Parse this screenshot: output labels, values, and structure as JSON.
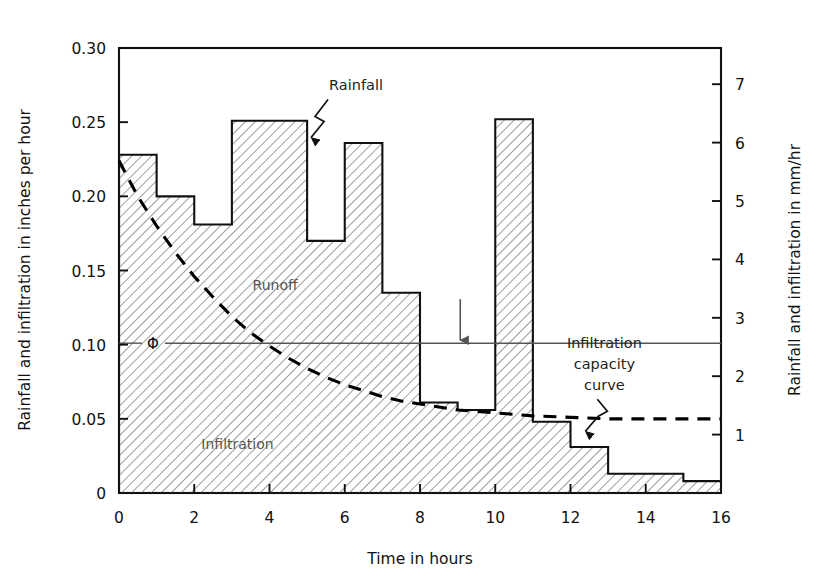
{
  "chart_data": {
    "type": "bar",
    "title": "",
    "subtitle": "",
    "xlabel": "Time in hours",
    "ylabel": "Rainfall and infiltration in inches per hour",
    "y2label": "Rainfall and infiltration in mm/hr",
    "xlim": [
      0,
      16
    ],
    "ylim": [
      0,
      0.3
    ],
    "y2lim": [
      0,
      7.62
    ],
    "grid": false,
    "legend_position": "none",
    "xticks": [
      0,
      2,
      4,
      6,
      8,
      10,
      12,
      14,
      16
    ],
    "xticklabels": [
      "0",
      "2",
      "4",
      "6",
      "8",
      "10",
      "12",
      "14",
      "16"
    ],
    "yticks": [
      0,
      0.05,
      0.1,
      0.15,
      0.2,
      0.25,
      0.3
    ],
    "yticklabels": [
      "0",
      "0.05",
      "0.10",
      "0.15",
      "0.20",
      "0.25",
      "0.30"
    ],
    "y2ticks": [
      1,
      2,
      3,
      4,
      5,
      6,
      7
    ],
    "y2ticklabels": [
      "1",
      "2",
      "3",
      "4",
      "5",
      "6",
      "7"
    ],
    "series": [
      {
        "name": "Rainfall hyetograph",
        "type": "step-bar",
        "unit": "inches per hour",
        "bins": [
          {
            "x0": 0,
            "x1": 1,
            "value": 0.228
          },
          {
            "x0": 1,
            "x1": 2,
            "value": 0.2
          },
          {
            "x0": 2,
            "x1": 3,
            "value": 0.181
          },
          {
            "x0": 3,
            "x1": 5,
            "value": 0.251
          },
          {
            "x0": 5,
            "x1": 6,
            "value": 0.17
          },
          {
            "x0": 6,
            "x1": 7,
            "value": 0.236
          },
          {
            "x0": 7,
            "x1": 8,
            "value": 0.135
          },
          {
            "x0": 8,
            "x1": 9,
            "value": 0.061
          },
          {
            "x0": 9,
            "x1": 10,
            "value": 0.056
          },
          {
            "x0": 10,
            "x1": 11,
            "value": 0.252
          },
          {
            "x0": 11,
            "x1": 12,
            "value": 0.048
          },
          {
            "x0": 12,
            "x1": 13,
            "value": 0.031
          },
          {
            "x0": 13,
            "x1": 15,
            "value": 0.013
          },
          {
            "x0": 15,
            "x1": 16,
            "value": 0.008
          }
        ]
      },
      {
        "name": "Infiltration capacity curve",
        "type": "line",
        "style": "dashed",
        "unit": "inches per hour",
        "points": [
          {
            "x": 0.0,
            "y": 0.224
          },
          {
            "x": 0.5,
            "y": 0.2
          },
          {
            "x": 1.0,
            "y": 0.18
          },
          {
            "x": 1.5,
            "y": 0.162
          },
          {
            "x": 2.0,
            "y": 0.146
          },
          {
            "x": 2.5,
            "y": 0.132
          },
          {
            "x": 3.0,
            "y": 0.119
          },
          {
            "x": 3.5,
            "y": 0.108
          },
          {
            "x": 4.0,
            "y": 0.099
          },
          {
            "x": 4.5,
            "y": 0.091
          },
          {
            "x": 5.0,
            "y": 0.084
          },
          {
            "x": 5.5,
            "y": 0.078
          },
          {
            "x": 6.0,
            "y": 0.073
          },
          {
            "x": 6.5,
            "y": 0.069
          },
          {
            "x": 7.0,
            "y": 0.065
          },
          {
            "x": 7.5,
            "y": 0.062
          },
          {
            "x": 8.0,
            "y": 0.06
          },
          {
            "x": 8.5,
            "y": 0.058
          },
          {
            "x": 9.0,
            "y": 0.056
          },
          {
            "x": 9.5,
            "y": 0.055
          },
          {
            "x": 10.0,
            "y": 0.054
          },
          {
            "x": 11.0,
            "y": 0.052
          },
          {
            "x": 12.0,
            "y": 0.051
          },
          {
            "x": 13.0,
            "y": 0.05
          },
          {
            "x": 14.0,
            "y": 0.05
          },
          {
            "x": 15.0,
            "y": 0.05
          },
          {
            "x": 16.0,
            "y": 0.05
          }
        ]
      },
      {
        "name": "Phi index line",
        "type": "hline",
        "unit": "inches per hour",
        "value": 0.101
      }
    ],
    "annotations": [
      {
        "id": "rainfall",
        "text": "Rainfall",
        "x": 6.3,
        "y": 0.272,
        "leader": "zigzag"
      },
      {
        "id": "runoff",
        "text": "Runoff",
        "x": 4.15,
        "y": 0.137,
        "leader": "none"
      },
      {
        "id": "infiltration",
        "text": "Infiltration",
        "x": 3.15,
        "y": 0.03,
        "leader": "none"
      },
      {
        "id": "phi",
        "text": "Φ",
        "x": 0.25,
        "y": 0.101,
        "leader": "tick"
      },
      {
        "id": "capacity",
        "text": "Infiltration capacity curve",
        "x": 12.9,
        "y": 0.101,
        "leader": "zigzag"
      },
      {
        "id": "arrow",
        "text": "",
        "x": 9.07,
        "y": 0.101,
        "leader": "down-arrow"
      }
    ]
  },
  "labels": {
    "y_axis_title": "Rainfall and infiltration in inches per hour",
    "y2_axis_title": "Rainfall and infiltration in mm/hr",
    "x_axis_title": "Time in hours",
    "rainfall": "Rainfall",
    "runoff": "Runoff",
    "infiltration": "Infiltration",
    "phi_symbol": "Φ",
    "capacity_line1": "Infiltration",
    "capacity_line2": "capacity",
    "capacity_line3": "curve"
  },
  "colors": {
    "background": "#ffffff",
    "axis": "#111111",
    "hatch": "#333333",
    "dashed_curve": "#000000",
    "phi_line": "#555555",
    "text": "#111111"
  }
}
